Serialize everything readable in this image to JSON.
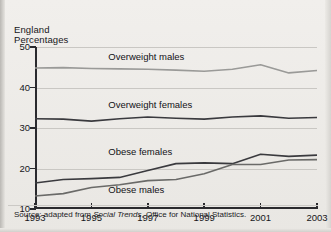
{
  "axis_titles": {
    "line1": "England",
    "line2": "Percentages"
  },
  "source": {
    "prefix": "Source: adapted from ",
    "italic": "Social Trends",
    "suffix": ", Office for National Statistics."
  },
  "chart_data": {
    "type": "line",
    "title": "",
    "subtitle": "",
    "xlabel": "",
    "ylabel": "Percentages",
    "region": "England",
    "grid": true,
    "legend": "inline-labels",
    "xlim": [
      1993,
      2003
    ],
    "ylim": [
      10,
      50
    ],
    "yticks": [
      50,
      40,
      30,
      20,
      10
    ],
    "xticks": [
      1993,
      1995,
      1997,
      1999,
      2001,
      2003
    ],
    "x": [
      1993,
      1994,
      1995,
      1996,
      1997,
      1998,
      1999,
      2000,
      2001,
      2002,
      2003
    ],
    "series": [
      {
        "name": "Overweight males",
        "color": "#9a9a98",
        "label_x": 1995.6,
        "label_y": 47.6,
        "values": [
          44.8,
          44.9,
          44.7,
          44.6,
          44.5,
          44.3,
          44.0,
          44.5,
          45.6,
          43.6,
          44.2
        ]
      },
      {
        "name": "Overweight females",
        "color": "#3a3a3e",
        "label_x": 1995.6,
        "label_y": 35.6,
        "values": [
          32.3,
          32.2,
          31.7,
          32.3,
          32.7,
          32.4,
          32.2,
          32.7,
          33.0,
          32.4,
          32.6
        ]
      },
      {
        "name": "Obese females",
        "color": "#3a3a3e",
        "label_x": 1995.6,
        "label_y": 24.0,
        "values": [
          16.4,
          17.3,
          17.5,
          17.8,
          19.5,
          21.2,
          21.4,
          21.2,
          23.5,
          23.0,
          23.3
        ]
      },
      {
        "name": "Obese males",
        "color": "#6a6a68",
        "label_x": 1995.6,
        "label_y": 14.7,
        "values": [
          13.2,
          13.8,
          15.3,
          16.0,
          17.0,
          17.3,
          18.7,
          21.0,
          21.0,
          22.1,
          22.2
        ]
      }
    ]
  }
}
